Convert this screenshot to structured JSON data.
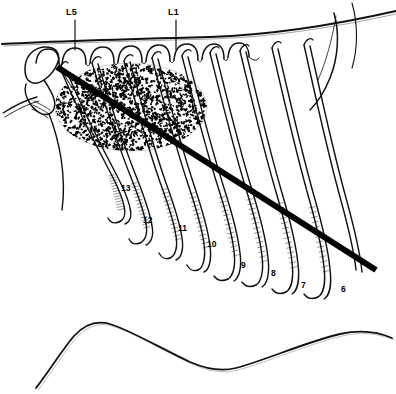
{
  "figure": {
    "name": "equine-thoracolumbar-skeletal-diagram",
    "background_color": "#ffffff",
    "ink_color": "#000000",
    "width": 396,
    "height": 394
  },
  "vertebra_labels": [
    {
      "id": "L5",
      "text": "L5",
      "x": 66,
      "y": 8,
      "leader_x": 75,
      "leader_y1": 20,
      "leader_y2": 50
    },
    {
      "id": "L1",
      "text": "L1",
      "x": 168,
      "y": 8,
      "leader_x": 176,
      "leader_y1": 20,
      "leader_y2": 50
    }
  ],
  "rib_labels": [
    {
      "id": "rib-13",
      "text": "13",
      "x": 121,
      "y": 184
    },
    {
      "id": "rib-12",
      "text": "12",
      "x": 143,
      "y": 216
    },
    {
      "id": "rib-11",
      "text": "11",
      "x": 178,
      "y": 224
    },
    {
      "id": "rib-10",
      "text": "10",
      "x": 207,
      "y": 240
    },
    {
      "id": "rib-9",
      "text": "9",
      "x": 241,
      "y": 261
    },
    {
      "id": "rib-8",
      "text": "8",
      "x": 271,
      "y": 269
    },
    {
      "id": "rib-7",
      "text": "7",
      "x": 301,
      "y": 281
    },
    {
      "id": "rib-6",
      "text": "6",
      "x": 341,
      "y": 285
    }
  ],
  "marker_line": {
    "name": "diagonal-reference-line",
    "x1": 57,
    "y1": 67,
    "x2": 376,
    "y2": 270,
    "stroke_width": 6,
    "color": "#000000"
  },
  "stipple_mass": {
    "name": "longissimus-muscle-stipple",
    "center_x": 131,
    "center_y": 107,
    "radius_x": 76,
    "radius_y": 44,
    "dot_count": 1500
  },
  "structures": [
    {
      "id": "dorsal-contour",
      "label": "dorsal body contour"
    },
    {
      "id": "ventral-contour",
      "label": "ventral body contour"
    },
    {
      "id": "spinous-processes",
      "label": "lumbar spinous processes"
    },
    {
      "id": "ilium",
      "label": "ilium / tuber coxae"
    },
    {
      "id": "scapula",
      "label": "scapula outline"
    },
    {
      "id": "rib-cage",
      "label": "rib cage"
    }
  ]
}
